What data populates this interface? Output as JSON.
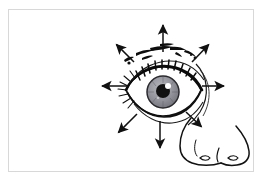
{
  "figure": {
    "title": "Eye movement directions",
    "description": "Line drawing of a human eye with eyebrow, eyelashes and nose, surrounded by eight arrows radiating outward indicating gaze directions",
    "background_color": "#ffffff",
    "ink_color": "#000000",
    "border_color": "#d8d8d8",
    "frame": {
      "x": 8,
      "y": 9,
      "width": 246,
      "height": 163
    }
  },
  "anatomy": {
    "eye": {
      "label": "eye",
      "center": {
        "x": 163,
        "y": 92
      },
      "iris": {
        "label": "iris",
        "color": "#8e8e96",
        "center": {
          "x": 163,
          "y": 92
        },
        "radius": 16
      },
      "pupil": {
        "label": "pupil",
        "color": "#111111",
        "center": {
          "x": 163,
          "y": 91
        },
        "radius": 7
      },
      "highlight": {
        "label": "corneal-highlight",
        "color": "#ffffff",
        "center": {
          "x": 168,
          "y": 86
        },
        "radius": 3
      },
      "sclera_color": "#ffffff"
    },
    "eyebrow": {
      "label": "eyebrow",
      "style": "broken sketchy stroke"
    },
    "upper_lid": {
      "label": "upper-eyelid-with-lashes",
      "style": "dense hatching"
    },
    "lower_lid": {
      "label": "lower-eyelid",
      "style": "thin curved stroke"
    },
    "nose": {
      "label": "nose",
      "style": "outline with two nostrils"
    }
  },
  "arrows": [
    {
      "name": "arrow-up",
      "direction": "up",
      "angle_deg": 270,
      "tail": {
        "x": 163,
        "y": 52
      },
      "head": {
        "x": 163,
        "y": 16
      }
    },
    {
      "name": "arrow-up-right",
      "direction": "up-right",
      "angle_deg": 315,
      "tail": {
        "x": 192,
        "y": 62
      },
      "head": {
        "x": 215,
        "y": 38
      }
    },
    {
      "name": "arrow-right",
      "direction": "right",
      "angle_deg": 0,
      "tail": {
        "x": 202,
        "y": 86
      },
      "head": {
        "x": 233,
        "y": 86
      }
    },
    {
      "name": "arrow-down-right",
      "direction": "down-right",
      "angle_deg": 45,
      "tail": {
        "x": 186,
        "y": 112
      },
      "head": {
        "x": 208,
        "y": 133
      }
    },
    {
      "name": "arrow-down",
      "direction": "down",
      "angle_deg": 90,
      "tail": {
        "x": 160,
        "y": 121
      },
      "head": {
        "x": 160,
        "y": 157
      }
    },
    {
      "name": "arrow-down-left",
      "direction": "down-left",
      "angle_deg": 135,
      "tail": {
        "x": 137,
        "y": 114
      },
      "head": {
        "x": 112,
        "y": 139
      }
    },
    {
      "name": "arrow-left",
      "direction": "left",
      "angle_deg": 180,
      "tail": {
        "x": 127,
        "y": 86
      },
      "head": {
        "x": 93,
        "y": 86
      }
    },
    {
      "name": "arrow-up-left",
      "direction": "up-left",
      "angle_deg": 225,
      "tail": {
        "x": 134,
        "y": 62
      },
      "head": {
        "x": 110,
        "y": 38
      }
    }
  ]
}
